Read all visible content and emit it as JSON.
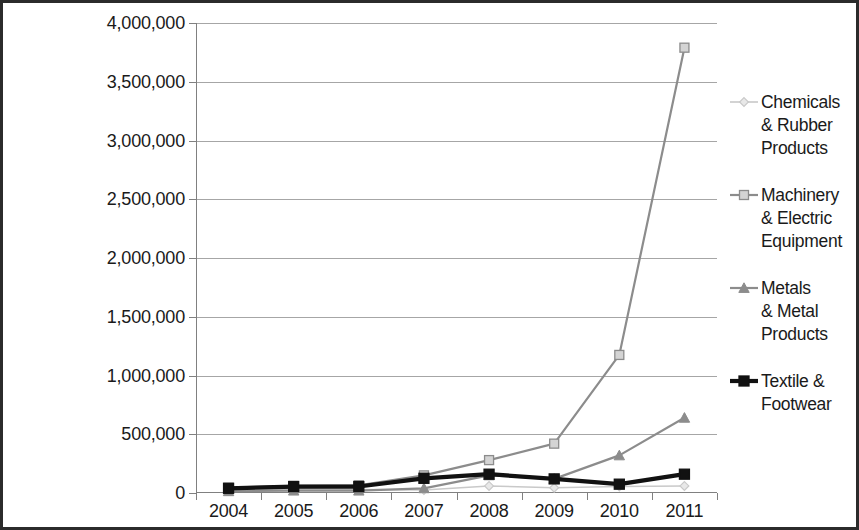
{
  "chart_data": {
    "type": "line",
    "title": "",
    "subtitle": "",
    "xlabel": "",
    "ylabel": "",
    "categories": [
      "2004",
      "2005",
      "2006",
      "2007",
      "2008",
      "2009",
      "2010",
      "2011"
    ],
    "ylim": [
      0,
      4000000
    ],
    "ytick_values": [
      0,
      500000,
      1000000,
      1500000,
      2000000,
      2500000,
      3000000,
      3500000,
      4000000
    ],
    "ytick_labels": [
      "0",
      "500,000",
      "1,000,000",
      "1,500,000",
      "2,000,000",
      "2,500,000",
      "3,000,000",
      "3,500,000",
      "4,000,000"
    ],
    "grid": true,
    "grid_axis": "y",
    "legend_position": "right",
    "series": [
      {
        "name": "Chemicals & Rubber Products",
        "label_lines": [
          "Chemicals",
          "& Rubber",
          "Products"
        ],
        "marker": "diamond",
        "color": "#c9c9c9",
        "line_width": 1.6,
        "values": [
          20000,
          35000,
          30000,
          25000,
          60000,
          45000,
          55000,
          60000
        ]
      },
      {
        "name": "Machinery & Electric Equipment",
        "label_lines": [
          "Machinery",
          "& Electric",
          "Equipment"
        ],
        "marker": "square",
        "color": "#8c8c8c",
        "line_width": 2.2,
        "values": [
          45000,
          60000,
          65000,
          150000,
          280000,
          420000,
          1175000,
          3790000
        ]
      },
      {
        "name": "Metals & Metal Products",
        "label_lines": [
          "Metals",
          "& Metal",
          "Products"
        ],
        "marker": "triangle",
        "color": "#8c8c8c",
        "line_width": 2.2,
        "values": [
          15000,
          20000,
          20000,
          40000,
          150000,
          120000,
          320000,
          640000
        ]
      },
      {
        "name": "Textile & Footwear",
        "label_lines": [
          "Textile &",
          "Footwear"
        ],
        "marker": "square",
        "color": "#111111",
        "line_width": 4.2,
        "values": [
          40000,
          55000,
          55000,
          125000,
          160000,
          120000,
          75000,
          160000
        ]
      }
    ]
  },
  "colors": {
    "frame_border": "#2b2b2b",
    "gridline": "#a6a6a6",
    "axis": "#808080",
    "text": "#1a1a1a",
    "background": "#ffffff"
  }
}
